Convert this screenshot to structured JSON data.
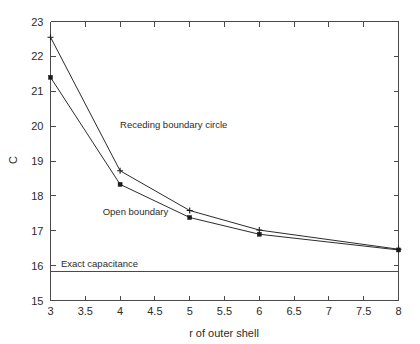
{
  "chart_data": {
    "type": "line",
    "title": "",
    "xlabel": "r of outer shell",
    "ylabel": "C",
    "xlim": [
      3,
      8
    ],
    "ylim": [
      15,
      23
    ],
    "grid": false,
    "legend_position": "none",
    "x_ticks": [
      "3",
      "3.5",
      "4",
      "4.5",
      "5",
      "5.5",
      "6",
      "6.5",
      "7",
      "7.5",
      "8"
    ],
    "x_tick_values": [
      3,
      3.5,
      4,
      4.5,
      5,
      5.5,
      6,
      6.5,
      7,
      7.5,
      8
    ],
    "y_ticks": [
      "15",
      "16",
      "17",
      "18",
      "19",
      "20",
      "21",
      "22",
      "23"
    ],
    "y_tick_values": [
      15,
      16,
      17,
      18,
      19,
      20,
      21,
      22,
      23
    ],
    "x": [
      3,
      4,
      5,
      6,
      8
    ],
    "series": [
      {
        "name": "Receding boundary circle",
        "values": [
          22.55,
          18.72,
          17.58,
          17.02,
          16.47
        ],
        "marker": "plus"
      },
      {
        "name": "Open boundary",
        "values": [
          21.4,
          18.33,
          17.38,
          16.9,
          16.45
        ],
        "marker": "square"
      }
    ],
    "reference_lines": [
      {
        "name": "Exact capacitance",
        "value": 15.82,
        "orientation": "horizontal"
      }
    ],
    "annotations": [
      {
        "text": "Receding boundary circle",
        "x": 4.0,
        "y": 19.95
      },
      {
        "text": "Open boundary",
        "x": 3.75,
        "y": 17.45
      },
      {
        "text": "Exact capacitance",
        "x": 3.15,
        "y": 15.95
      }
    ]
  }
}
